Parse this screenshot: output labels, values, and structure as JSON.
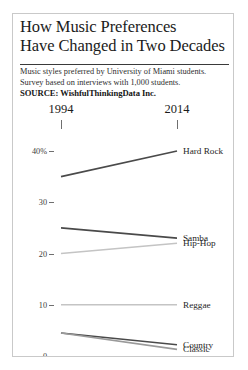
{
  "title": {
    "line1": "How Music Preferences",
    "line2": "Have Changed in Two Decades"
  },
  "subtitle": {
    "line1": "Music styles preferred by University of Miami students.",
    "line2": "Survey based on interviews with 1,000 students.",
    "source": "SOURCE: WishfulThinkingData Inc."
  },
  "colors": {
    "dark_line": "#4a4a4a",
    "light_line": "#c4c4c4",
    "text": "#1b1b1b",
    "rule": "#3a3a3a",
    "border": "#c9c9c9",
    "background": "#ffffff"
  },
  "chart_data": {
    "type": "line",
    "title": "How Music Preferences Have Changed in Two Decades",
    "subtitle": "Music styles preferred by University of Miami students. Survey based on interviews with 1,000 students.",
    "source": "SOURCE: WishfulThinkingData Inc.",
    "xlabel": "",
    "ylabel": "",
    "categories": [
      "1994",
      "2014"
    ],
    "x_tick_labels": [
      "1994",
      "2014"
    ],
    "y_tick_labels": [
      "40%",
      "30",
      "20",
      "10",
      "0"
    ],
    "y_ticks": [
      40,
      30,
      20,
      10,
      0
    ],
    "ylim": [
      0,
      42
    ],
    "grid": false,
    "legend": "right-inline-labels",
    "series": [
      {
        "name": "Hard Rock",
        "values": [
          35,
          40
        ],
        "color": "#4a4a4a"
      },
      {
        "name": "Samba",
        "values": [
          25,
          23
        ],
        "color": "#4a4a4a"
      },
      {
        "name": "Hip-Hop",
        "values": [
          20,
          22
        ],
        "color": "#c4c4c4"
      },
      {
        "name": "Reggae",
        "values": [
          10,
          10
        ],
        "color": "#c4c4c4"
      },
      {
        "name": "Country",
        "values": [
          4.5,
          2.2
        ],
        "color": "#4a4a4a"
      },
      {
        "name": "Classic",
        "values": [
          4.5,
          1.3
        ],
        "color": "#9a9a9a"
      }
    ]
  }
}
